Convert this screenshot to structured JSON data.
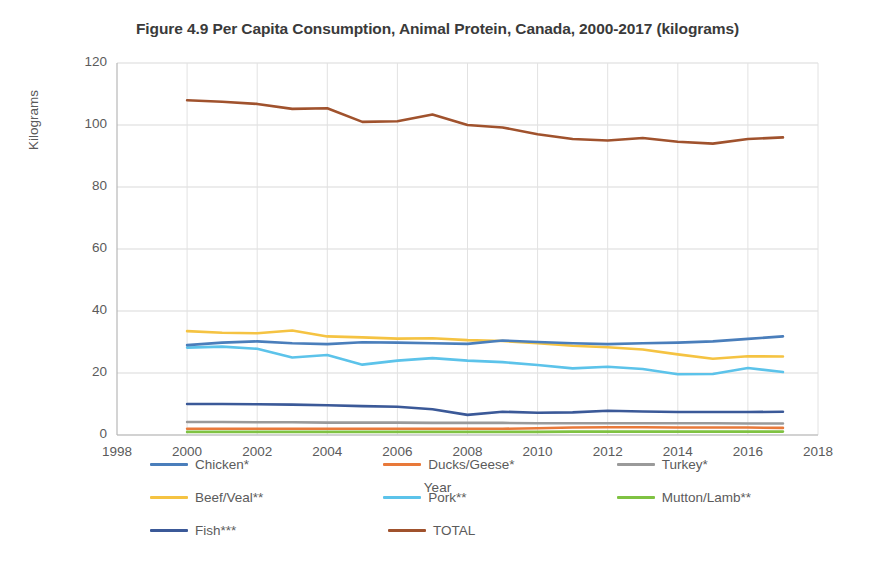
{
  "chart_data": {
    "type": "line",
    "title": "Figure 4.9 Per Capita Consumption, Animal Protein, Canada, 2000-2017 (kilograms)",
    "xlabel": "Year",
    "ylabel": "Kilograms",
    "xlim": [
      1998,
      2018
    ],
    "ylim": [
      0,
      120
    ],
    "xticks": [
      "1998",
      "2000",
      "2002",
      "2004",
      "2006",
      "2008",
      "2010",
      "2012",
      "2014",
      "2016",
      "2018"
    ],
    "yticks": [
      "0",
      "20",
      "40",
      "60",
      "80",
      "100",
      "120"
    ],
    "grid": true,
    "legend_position": "bottom",
    "x": [
      2000,
      2001,
      2002,
      2003,
      2004,
      2005,
      2006,
      2007,
      2008,
      2009,
      2010,
      2011,
      2012,
      2013,
      2014,
      2015,
      2016,
      2017
    ],
    "series": [
      {
        "name": "Chicken*",
        "color": "#4a7ebb",
        "values": [
          29.0,
          29.8,
          30.2,
          29.6,
          29.3,
          29.9,
          29.8,
          29.6,
          29.4,
          30.5,
          30.0,
          29.6,
          29.3,
          29.6,
          29.8,
          30.2,
          31.0,
          31.8
        ]
      },
      {
        "name": "Ducks/Geese*",
        "color": "#e8793a",
        "values": [
          2.0,
          2.0,
          2.0,
          2.0,
          2.0,
          2.0,
          2.0,
          2.0,
          2.0,
          2.0,
          2.2,
          2.4,
          2.5,
          2.5,
          2.4,
          2.4,
          2.4,
          2.3
        ]
      },
      {
        "name": "Turkey*",
        "color": "#9a9a9a",
        "values": [
          4.2,
          4.2,
          4.1,
          4.1,
          4.0,
          4.0,
          4.0,
          3.9,
          3.9,
          3.9,
          3.8,
          3.8,
          3.8,
          3.8,
          3.8,
          3.8,
          3.7,
          3.7
        ]
      },
      {
        "name": "Beef/Veal**",
        "color": "#f5c342",
        "values": [
          33.5,
          33.0,
          32.8,
          33.7,
          31.8,
          31.5,
          31.1,
          31.2,
          30.6,
          30.3,
          29.6,
          28.8,
          28.3,
          27.6,
          26.0,
          24.6,
          25.4,
          25.3
        ]
      },
      {
        "name": "Pork**",
        "color": "#5cc3ea",
        "values": [
          28.2,
          28.5,
          27.8,
          25.0,
          25.8,
          22.7,
          24.0,
          24.8,
          24.0,
          23.5,
          22.6,
          21.5,
          22.0,
          21.3,
          19.6,
          19.7,
          21.6,
          20.3
        ]
      },
      {
        "name": "Mutton/Lamb**",
        "color": "#7fc242",
        "values": [
          1.0,
          1.0,
          1.0,
          1.0,
          1.0,
          1.0,
          1.0,
          1.0,
          1.0,
          1.0,
          1.0,
          1.1,
          1.1,
          1.1,
          1.1,
          1.1,
          1.1,
          1.1
        ]
      },
      {
        "name": "Fish***",
        "color": "#3b5998",
        "values": [
          10.0,
          10.0,
          9.9,
          9.8,
          9.6,
          9.3,
          9.1,
          8.3,
          6.5,
          7.5,
          7.2,
          7.3,
          7.8,
          7.6,
          7.4,
          7.4,
          7.4,
          7.5
        ]
      },
      {
        "name": "TOTAL",
        "color": "#a0522d",
        "values": [
          108.0,
          107.5,
          106.8,
          105.2,
          105.4,
          101.0,
          101.2,
          103.4,
          100.0,
          99.2,
          97.0,
          95.5,
          95.0,
          95.8,
          94.6,
          94.0,
          95.5,
          96.0
        ]
      }
    ]
  }
}
